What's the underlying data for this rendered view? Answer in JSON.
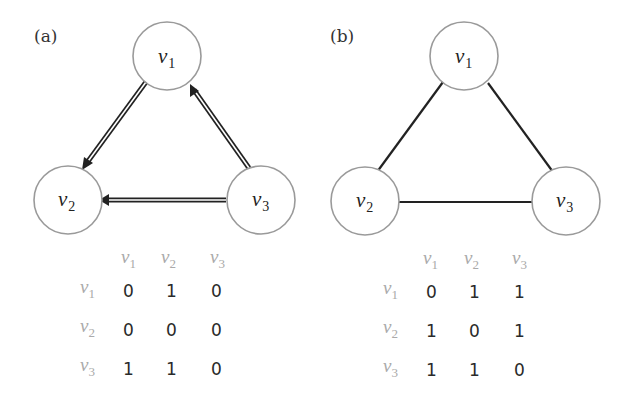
{
  "panels": [
    {
      "label": "(a)",
      "type": "directed",
      "nodes": [
        {
          "id": "v1",
          "base": "v",
          "sub": "1"
        },
        {
          "id": "v2",
          "base": "v",
          "sub": "2"
        },
        {
          "id": "v3",
          "base": "v",
          "sub": "3"
        }
      ],
      "edges": [
        {
          "from": "v1",
          "to": "v2"
        },
        {
          "from": "v3",
          "to": "v1"
        },
        {
          "from": "v3",
          "to": "v2"
        }
      ],
      "matrix": {
        "col_headers": [
          {
            "base": "v",
            "sub": "1"
          },
          {
            "base": "v",
            "sub": "2"
          },
          {
            "base": "v",
            "sub": "3"
          }
        ],
        "row_headers": [
          {
            "base": "v",
            "sub": "1"
          },
          {
            "base": "v",
            "sub": "2"
          },
          {
            "base": "v",
            "sub": "3"
          }
        ],
        "rows": [
          [
            "0",
            "1",
            "0"
          ],
          [
            "0",
            "0",
            "0"
          ],
          [
            "1",
            "1",
            "0"
          ]
        ]
      }
    },
    {
      "label": "(b)",
      "type": "undirected",
      "nodes": [
        {
          "id": "v1",
          "base": "v",
          "sub": "1"
        },
        {
          "id": "v2",
          "base": "v",
          "sub": "2"
        },
        {
          "id": "v3",
          "base": "v",
          "sub": "3"
        }
      ],
      "edges": [
        {
          "from": "v1",
          "to": "v2"
        },
        {
          "from": "v1",
          "to": "v3"
        },
        {
          "from": "v2",
          "to": "v3"
        }
      ],
      "matrix": {
        "col_headers": [
          {
            "base": "v",
            "sub": "1"
          },
          {
            "base": "v",
            "sub": "2"
          },
          {
            "base": "v",
            "sub": "3"
          }
        ],
        "row_headers": [
          {
            "base": "v",
            "sub": "1"
          },
          {
            "base": "v",
            "sub": "2"
          },
          {
            "base": "v",
            "sub": "3"
          }
        ],
        "rows": [
          [
            "0",
            "1",
            "1"
          ],
          [
            "1",
            "0",
            "1"
          ],
          [
            "1",
            "1",
            "0"
          ]
        ]
      }
    }
  ],
  "colors": {
    "node_stroke": "#9a9a9a",
    "edge": "#222222",
    "header_text": "#aaaaaa",
    "cell_text": "#2a2a2a"
  }
}
